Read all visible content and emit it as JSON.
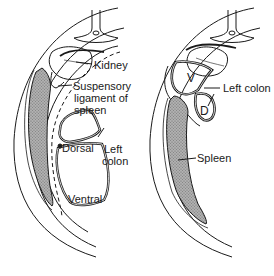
{
  "figure": {
    "panels": [
      {
        "id": "left",
        "labels": {
          "kidney": "Kidney",
          "suspensory_line1": "Suspensory",
          "suspensory_line2": "ligament  of",
          "suspensory_line3": "spleen",
          "dorsal": "Dorsal",
          "ventral": "Ventral",
          "left_colon_line1": "Left",
          "left_colon_line2": "colon"
        }
      },
      {
        "id": "right",
        "labels": {
          "left_colon": "Left  colon",
          "v": "V",
          "d": "D",
          "spleen": "Spleen"
        }
      }
    ],
    "colors": {
      "line": "#1a1a1a",
      "spleen_fill": "#9a9a9a",
      "background": "#ffffff"
    }
  }
}
